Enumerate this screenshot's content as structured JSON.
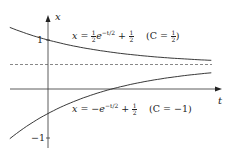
{
  "chart_data": {
    "type": "line",
    "title": "",
    "xlabel": "t",
    "ylabel": "x",
    "y_ticks": [
      {
        "value": 1,
        "label": "1"
      },
      {
        "value": -1,
        "label": "−1"
      }
    ],
    "xlim": [
      -0.8,
      3.6
    ],
    "ylim": [
      -1.1,
      1.3
    ],
    "grid": false,
    "series": [
      {
        "name": "upper",
        "equation": "x = ½ e^{-t/2} + ½",
        "constant": "C = ½",
        "x": [
          -0.8,
          0,
          0.5,
          1,
          1.5,
          2,
          2.5,
          3,
          3.5
        ],
        "values": [
          1.246,
          1.0,
          0.889,
          0.803,
          0.736,
          0.684,
          0.643,
          0.612,
          0.587
        ],
        "style": "solid"
      },
      {
        "name": "lower",
        "equation": "x = −e^{-t/2} + ½",
        "constant": "C = −1",
        "x": [
          -0.8,
          0,
          0.5,
          1,
          1.5,
          2,
          2.5,
          3,
          3.5
        ],
        "values": [
          -0.992,
          -0.5,
          -0.279,
          -0.107,
          0.028,
          0.132,
          0.213,
          0.277,
          0.326
        ],
        "style": "solid"
      },
      {
        "name": "equilibrium",
        "equation": "x = ½",
        "x": [
          -0.8,
          3.6
        ],
        "values": [
          0.5,
          0.5
        ],
        "style": "dashed"
      }
    ],
    "annotations": [
      "x = ½ e^{−t/2} + ½   (C = ½)",
      "x = −e^{−t/2} + ½   (C = −1)"
    ]
  },
  "labels": {
    "x_axis": "t",
    "y_axis": "x",
    "tick_one": "1",
    "tick_minus_one": "−1",
    "upper": {
      "lhs": "x = ",
      "half_num": "1",
      "half_den": "2",
      "exp_base": "e",
      "exp": "−t/2",
      "plus": " + ",
      "const": "(C = ",
      "close": ")"
    },
    "lower": {
      "lhs": "x = −",
      "exp_base": "e",
      "exp": "−t/2",
      "plus": " + ",
      "half_num": "1",
      "half_den": "2",
      "const": "(C = −1)"
    }
  }
}
